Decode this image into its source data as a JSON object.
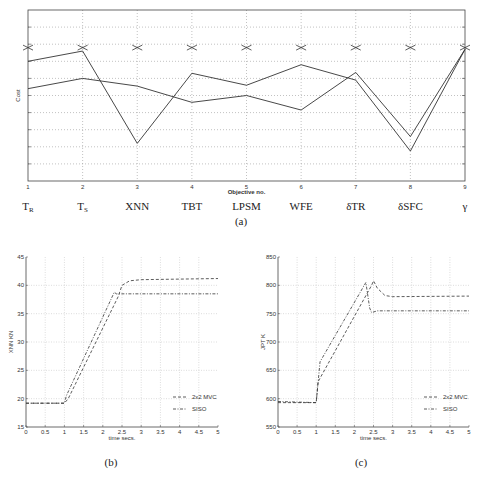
{
  "chart_data": [
    {
      "id": "a",
      "type": "line",
      "caption": "(a)",
      "xlabel": "Objective no.",
      "ylabel": "Cost",
      "x": [
        1,
        2,
        3,
        4,
        5,
        6,
        7,
        8,
        9
      ],
      "categories": [
        "T_R",
        "T_S",
        "XNN",
        "TBT",
        "LPSM",
        "WFE",
        "δTR",
        "δSFC",
        "γ"
      ],
      "category_labels": [
        {
          "main": "T",
          "sub": "R"
        },
        {
          "main": "T",
          "sub": "S"
        },
        {
          "main": "XNN",
          "sub": ""
        },
        {
          "main": "TBT",
          "sub": ""
        },
        {
          "main": "LPSM",
          "sub": ""
        },
        {
          "main": "WFE",
          "sub": ""
        },
        {
          "main": "δTR",
          "sub": ""
        },
        {
          "main": "δSFC",
          "sub": ""
        },
        {
          "main": "γ",
          "sub": ""
        }
      ],
      "ylim": [
        0,
        10
      ],
      "grid": true,
      "series": [
        {
          "name": "goal markers",
          "marker": "x",
          "values": [
            7.8,
            7.8,
            7.8,
            7.8,
            7.8,
            7.8,
            7.8,
            7.8,
            7.8
          ]
        },
        {
          "name": "solution 1",
          "values": [
            7.0,
            7.6,
            2.2,
            6.3,
            5.6,
            6.8,
            5.9,
            1.75,
            7.7
          ]
        },
        {
          "name": "solution 2",
          "values": [
            5.4,
            6.0,
            5.55,
            4.6,
            5.0,
            4.15,
            6.35,
            2.6,
            7.7
          ]
        }
      ]
    },
    {
      "id": "b",
      "type": "line",
      "caption": "(b)",
      "xlabel": "time secs.",
      "ylabel": "XNN KN",
      "xlim": [
        0,
        5
      ],
      "ylim": [
        15,
        45
      ],
      "xticks": [
        "0",
        "0.5",
        "1",
        "1.5",
        "2",
        "2.5",
        "3",
        "3.5",
        "4",
        "4.5",
        "5"
      ],
      "yticks": [
        "15",
        "20",
        "25",
        "30",
        "35",
        "40",
        "45"
      ],
      "grid": true,
      "legend": [
        "2x2 MVC",
        "SISO"
      ],
      "legend_position": "lower right",
      "series": [
        {
          "name": "2x2 MVC",
          "x": [
            0,
            1,
            1.1,
            2.4,
            2.5,
            2.7,
            3,
            5
          ],
          "values": [
            19.2,
            19.2,
            20,
            38,
            40,
            40.8,
            41,
            41.2
          ]
        },
        {
          "name": "SISO",
          "x": [
            0,
            1,
            1.05,
            2.3,
            2.35,
            5
          ],
          "values": [
            19.2,
            19.2,
            20.5,
            38.8,
            38.5,
            38.5
          ]
        }
      ]
    },
    {
      "id": "c",
      "type": "line",
      "caption": "(c)",
      "xlabel": "time secs.",
      "ylabel": "JPT K",
      "xlim": [
        0,
        5
      ],
      "ylim": [
        550,
        850
      ],
      "xticks": [
        "0",
        "0.5",
        "1",
        "1.5",
        "2",
        "2.5",
        "3",
        "3.5",
        "4",
        "4.5",
        "5"
      ],
      "yticks": [
        "550",
        "600",
        "650",
        "700",
        "750",
        "800",
        "850"
      ],
      "grid": true,
      "legend": [
        "2x2 MVC",
        "SISO"
      ],
      "legend_position": "lower right",
      "series": [
        {
          "name": "2x2 MVC",
          "x": [
            0,
            1,
            1.05,
            2.45,
            2.5,
            2.6,
            2.8,
            3,
            5
          ],
          "values": [
            593,
            593,
            630,
            800,
            808,
            795,
            782,
            780,
            781
          ]
        },
        {
          "name": "SISO",
          "x": [
            0,
            1,
            1.1,
            2.3,
            2.4,
            2.45,
            2.6,
            5
          ],
          "values": [
            595,
            593,
            665,
            805,
            760,
            752,
            755,
            755
          ]
        }
      ]
    }
  ]
}
